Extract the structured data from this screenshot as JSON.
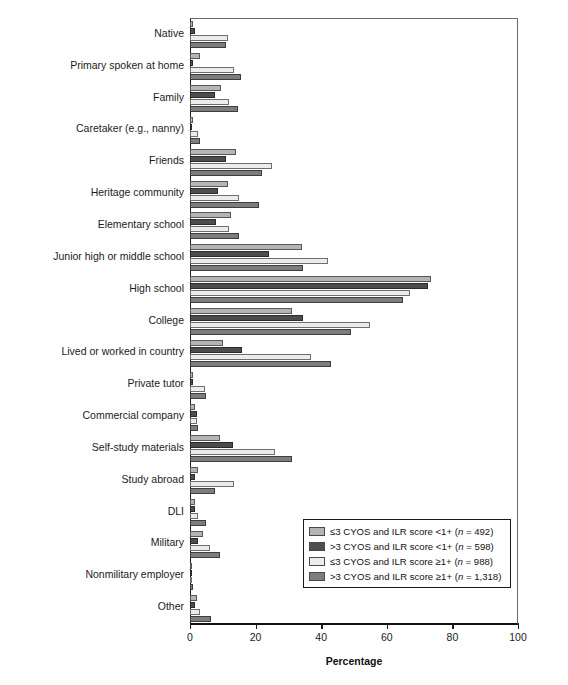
{
  "chart_data": {
    "type": "bar",
    "orientation": "horizontal",
    "title": "",
    "xlabel": "Percentage",
    "ylabel": "",
    "xlim": [
      0,
      100
    ],
    "xticks": [
      0,
      20,
      40,
      60,
      80,
      100
    ],
    "grid": false,
    "legend_position": "lower-right",
    "categories": [
      "Native",
      "Primary spoken at home",
      "Family",
      "Caretaker (e.g., nanny)",
      "Friends",
      "Heritage community",
      "Elementary school",
      "Junior high or middle school",
      "High school",
      "College",
      "Lived or worked in country",
      "Private tutor",
      "Commercial company",
      "Self-study materials",
      "Study abroad",
      "DLI",
      "Military",
      "Nonmilitary employer",
      "Other"
    ],
    "series": [
      {
        "name": "≤3 CYOS and ILR score <1+ (n = 492)",
        "color": "#b4b4b4",
        "values": [
          1.0,
          3.0,
          9.5,
          1.0,
          14.0,
          11.5,
          12.5,
          34.0,
          73.5,
          31.0,
          10.0,
          1.0,
          1.5,
          9.0,
          2.5,
          1.5,
          4.0,
          0.5,
          2.0
        ]
      },
      {
        "name": ">3 CYOS and ILR score <1+ (n = 598)",
        "color": "#4d4d4d",
        "values": [
          1.5,
          1.0,
          7.5,
          0.5,
          11.0,
          8.5,
          8.0,
          24.0,
          72.5,
          34.5,
          16.0,
          1.0,
          2.0,
          13.0,
          1.5,
          1.5,
          2.5,
          0.5,
          1.5
        ]
      },
      {
        "name": "≤3 CYOS and ILR score ≥1+ (n = 988)",
        "color": "#ececec",
        "values": [
          11.5,
          13.5,
          12.0,
          2.5,
          25.0,
          15.0,
          12.0,
          42.0,
          67.0,
          55.0,
          37.0,
          4.5,
          2.0,
          26.0,
          13.5,
          2.5,
          6.0,
          0.5,
          3.0
        ]
      },
      {
        "name": ">3 CYOS and ILR score ≥1+ (n = 1,318)",
        "color": "#7d7d7d",
        "values": [
          11.0,
          15.5,
          14.5,
          3.0,
          22.0,
          21.0,
          15.0,
          34.5,
          65.0,
          49.0,
          43.0,
          5.0,
          2.5,
          31.0,
          7.5,
          5.0,
          9.0,
          1.0,
          6.5
        ]
      }
    ]
  },
  "legend": {
    "entries": [
      {
        "prefix": "≤3 CYOS and ILR score <1+ (",
        "n_italic": "n",
        "suffix": " = 492)"
      },
      {
        "prefix": ">3 CYOS and ILR score <1+ (",
        "n_italic": "n",
        "suffix": " = 598)"
      },
      {
        "prefix": "≤3 CYOS and ILR score ≥1+ (",
        "n_italic": "n",
        "suffix": " = 988)"
      },
      {
        "prefix": ">3 CYOS and ILR score ≥1+ (",
        "n_italic": "n",
        "suffix": " = 1,318)"
      }
    ]
  },
  "axis": {
    "x_title": "Percentage",
    "x_tick_labels": [
      "0",
      "20",
      "40",
      "60",
      "80",
      "100"
    ]
  }
}
